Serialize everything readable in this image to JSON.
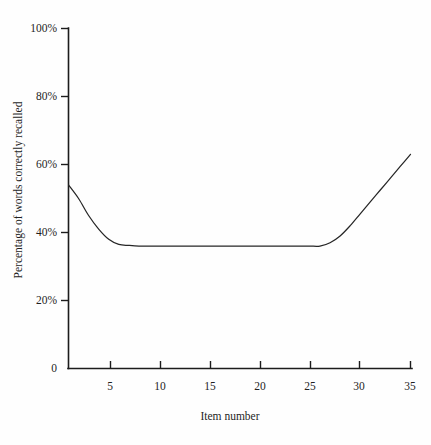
{
  "chart_data": {
    "type": "line",
    "title": "",
    "subtitle": "",
    "xlabel": "Item number",
    "ylabel": "Percentage of words correctly recalled",
    "grid": false,
    "legend": null,
    "xlim": [
      1,
      35
    ],
    "ylim": [
      0,
      100
    ],
    "x_ticks": [
      5,
      10,
      15,
      20,
      25,
      30,
      35
    ],
    "x_tick_labels": [
      "5",
      "10",
      "15",
      "20",
      "25",
      "30",
      "35"
    ],
    "y_ticks": [
      0,
      20,
      40,
      60,
      80,
      100
    ],
    "y_tick_labels": [
      "0",
      "20%",
      "40%",
      "60%",
      "80%",
      "100%"
    ],
    "series": [
      {
        "name": "Serial position curve",
        "x": [
          1,
          2,
          3,
          4,
          5,
          6,
          7,
          8,
          9,
          10,
          11,
          12,
          13,
          14,
          15,
          16,
          17,
          18,
          19,
          20,
          21,
          22,
          23,
          24,
          25,
          26,
          27,
          28,
          29,
          30,
          31,
          32,
          33,
          34,
          35
        ],
        "values": [
          54,
          50,
          45,
          41,
          38,
          36.5,
          36.2,
          36,
          36,
          36,
          36,
          36,
          36,
          36,
          36,
          36,
          36,
          36,
          36,
          36,
          36,
          36,
          36,
          36,
          36,
          36,
          37,
          39,
          42,
          45.5,
          49,
          52.5,
          56,
          59.5,
          63
        ]
      }
    ],
    "annotations": []
  },
  "axis": {
    "y_label": "Percentage of words correctly recalled",
    "x_label": "Item number",
    "zero_label": "0"
  },
  "colors": {
    "background": "#fefefe",
    "axis": "#1c1c1c",
    "curve": "#262626",
    "text": "#1f1f1f"
  }
}
